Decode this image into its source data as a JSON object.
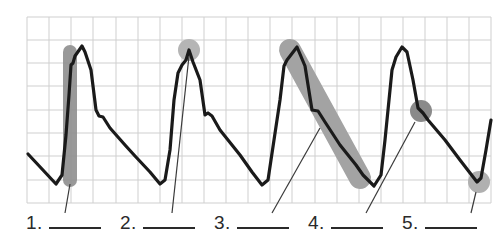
{
  "diagram": {
    "type": "labeled waveform diagram (arterial pressure pulse / ECG-style trace on grid)",
    "grid": {
      "x0": 27,
      "y0": 17,
      "x1": 491,
      "y1": 203,
      "cols": 21,
      "rows": 8,
      "line_color": "#cfcfcf"
    },
    "trace_color": "#1a1a1a",
    "highlight_color": "#8f8f8f",
    "highlight_color_light": "#b5b5b5",
    "labels": [
      {
        "id": 1,
        "number": "1.",
        "blank": "",
        "marker": "vertical-bar",
        "target": "upstroke of first wave"
      },
      {
        "id": 2,
        "number": "2.",
        "blank": "",
        "marker": "circle",
        "target": "peak of second wave"
      },
      {
        "id": 3,
        "number": "3.",
        "blank": "",
        "marker": "diagonal-bar",
        "target": "downslope of third wave"
      },
      {
        "id": 4,
        "number": "4.",
        "blank": "",
        "marker": "circle",
        "target": "notch on fourth wave downslope"
      },
      {
        "id": 5,
        "number": "5.",
        "blank": "",
        "marker": "circle",
        "target": "trough after fourth wave"
      }
    ]
  }
}
